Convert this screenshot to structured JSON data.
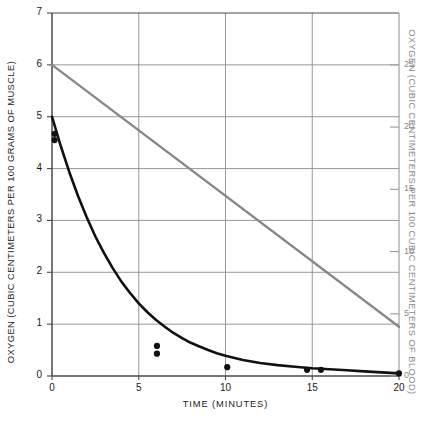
{
  "chart_data": {
    "type": "line",
    "title": "",
    "xlabel": "TIME  (MINUTES)",
    "ylabel": "OXYGEN (CUBIC CENTIMETERS PER 100 GRAMS OF MUSCLE)",
    "y2label": "OXYGEN (CUBIC CENTIMETERS PER 100 CUBIC CENTIMETERS OF BLOOD)",
    "xlim": [
      0,
      20
    ],
    "ylim": [
      0,
      7
    ],
    "y2lim": [
      0,
      29.17
    ],
    "xticks": [
      "0",
      "5",
      "10",
      "15",
      "20"
    ],
    "xtick_values": [
      0,
      5,
      10,
      15,
      20
    ],
    "yticks": [
      "0",
      "1",
      "2",
      "3",
      "4",
      "5",
      "6",
      "7"
    ],
    "ytick_values": [
      0,
      1,
      2,
      3,
      4,
      5,
      6,
      7
    ],
    "y2ticks": [
      "0",
      "5",
      "10",
      "15",
      "20",
      "25"
    ],
    "y2tick_values": [
      0,
      5,
      10,
      15,
      20,
      25
    ],
    "grid": true,
    "grid_color": "#8c8c8c",
    "legend": "none",
    "series": [
      {
        "name": "muscle-oxygen-decay",
        "axis": "left",
        "color": "#111111",
        "style": "solid",
        "width": 2.6,
        "x": [
          0.0,
          0.5,
          1.0,
          1.5,
          2.0,
          2.5,
          3.0,
          3.5,
          4.0,
          4.5,
          5.0,
          5.5,
          6.0,
          6.5,
          7.0,
          7.5,
          8.0,
          8.5,
          9.0,
          9.5,
          10.0,
          11.0,
          12.0,
          13.0,
          14.0,
          15.0,
          16.0,
          17.0,
          18.0,
          19.0,
          20.0
        ],
        "y": [
          5.0,
          4.44,
          3.93,
          3.47,
          3.06,
          2.69,
          2.37,
          2.08,
          1.82,
          1.6,
          1.4,
          1.23,
          1.08,
          0.95,
          0.83,
          0.73,
          0.64,
          0.57,
          0.5,
          0.44,
          0.39,
          0.31,
          0.25,
          0.21,
          0.18,
          0.15,
          0.13,
          0.11,
          0.09,
          0.07,
          0.05
        ]
      },
      {
        "name": "blood-oxygen-linear",
        "axis": "right",
        "color": "#878787",
        "style": "solid",
        "width": 2.3,
        "x": [
          0.0,
          20.0
        ],
        "y": [
          6.0,
          0.95
        ],
        "y_right": [
          25.0,
          4.0
        ]
      }
    ],
    "points": [
      {
        "x": 0.15,
        "y": 4.67
      },
      {
        "x": 0.15,
        "y": 4.55
      },
      {
        "x": 6.05,
        "y": 0.58
      },
      {
        "x": 6.05,
        "y": 0.43
      },
      {
        "x": 10.1,
        "y": 0.17
      },
      {
        "x": 14.7,
        "y": 0.12
      },
      {
        "x": 15.5,
        "y": 0.12
      },
      {
        "x": 20.0,
        "y": 0.05
      }
    ],
    "point_color": "#111111",
    "point_radius": 3.1
  }
}
